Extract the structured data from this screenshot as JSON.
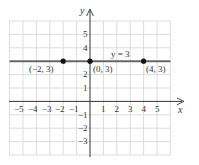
{
  "diagram": {
    "type": "coordinate-plane",
    "axes": {
      "x_label": "x",
      "y_label": "y"
    },
    "x_tick_labels": [
      "−5",
      "−4",
      "−3",
      "−2",
      "−1",
      "1",
      "2",
      "3",
      "4",
      "5"
    ],
    "y_tick_labels": [
      "5",
      "4",
      "2",
      "1",
      "−1",
      "−2",
      "−3"
    ],
    "line": {
      "equation": "y = 3",
      "color": "#555555"
    },
    "points": [
      {
        "label": "(−2, 3)",
        "x": -2,
        "y": 3
      },
      {
        "label": "(0, 3)",
        "x": 0,
        "y": 3
      },
      {
        "label": "(4, 3)",
        "x": 4,
        "y": 3
      }
    ],
    "grid": {
      "x_range": [
        -6,
        6
      ],
      "y_range": [
        -4,
        6
      ],
      "color": "#d8d8d8"
    }
  }
}
